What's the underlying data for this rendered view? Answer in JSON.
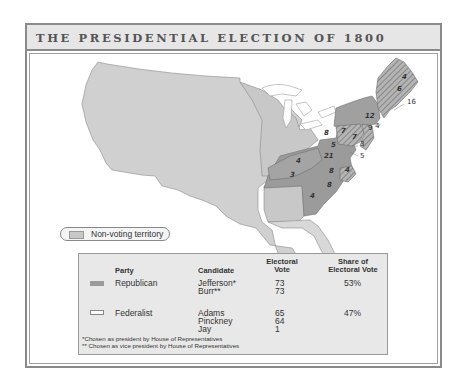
{
  "title": "THE PRESIDENTIAL ELECTION OF 1800",
  "map": {
    "state_votes": [
      {
        "label": "16",
        "x": 407,
        "y": 104,
        "italic": false
      },
      {
        "label": "4",
        "x": 402,
        "y": 79,
        "italic": true
      },
      {
        "label": "6",
        "x": 397,
        "y": 91,
        "italic": true
      },
      {
        "label": "12",
        "x": 365,
        "y": 118,
        "italic": true
      },
      {
        "label": "4",
        "x": 375,
        "y": 128,
        "italic": false
      },
      {
        "label": "9",
        "x": 368,
        "y": 130,
        "italic": false
      },
      {
        "label": "8",
        "x": 324,
        "y": 135,
        "italic": true
      },
      {
        "label": "7",
        "x": 341,
        "y": 133,
        "italic": true
      },
      {
        "label": "7",
        "x": 352,
        "y": 139,
        "italic": true
      },
      {
        "label": "3",
        "x": 360,
        "y": 146,
        "italic": false
      },
      {
        "label": "5",
        "x": 331,
        "y": 147,
        "italic": true
      },
      {
        "label": "21",
        "x": 324,
        "y": 158,
        "italic": true
      },
      {
        "label": "5",
        "x": 360,
        "y": 158,
        "italic": false
      },
      {
        "label": "4",
        "x": 296,
        "y": 163,
        "italic": true
      },
      {
        "label": "8",
        "x": 329,
        "y": 173,
        "italic": true
      },
      {
        "label": "4",
        "x": 345,
        "y": 172,
        "italic": true
      },
      {
        "label": "3",
        "x": 290,
        "y": 177,
        "italic": true
      },
      {
        "label": "8",
        "x": 327,
        "y": 187,
        "italic": true
      },
      {
        "label": "4",
        "x": 310,
        "y": 198,
        "italic": true
      }
    ]
  },
  "legend": {
    "non_voting_label": "Non-voting territory"
  },
  "table": {
    "headers": {
      "party": "Party",
      "candidate": "Candidate",
      "electoral_vote_line1": "Electoral",
      "electoral_vote_line2": "Vote",
      "share_line1": "Share of",
      "share_line2": "Electoral Vote"
    },
    "rows": [
      {
        "party": "Republican",
        "candidates": [
          "Jefferson*",
          "Burr**"
        ],
        "votes": [
          "73",
          "73"
        ],
        "share": "53%"
      },
      {
        "party": "Federalist",
        "candidates": [
          "Adams",
          "Pinckney",
          "Jay"
        ],
        "votes": [
          "65",
          "64",
          "1"
        ],
        "share": "47%"
      }
    ],
    "footnotes": [
      "*Chosen as president by House of Representatives",
      "** Chosen as vice president by House of Representatives"
    ]
  },
  "chart_data": {
    "type": "table",
    "title": "THE PRESIDENTIAL ELECTION OF 1800",
    "columns": [
      "Party",
      "Candidate",
      "Electoral Vote",
      "Share of Electoral Vote"
    ],
    "rows": [
      [
        "Republican",
        "Jefferson*",
        73,
        "53%"
      ],
      [
        "Republican",
        "Burr**",
        73,
        ""
      ],
      [
        "Federalist",
        "Adams",
        65,
        "47%"
      ],
      [
        "Federalist",
        "Pinckney",
        64,
        ""
      ],
      [
        "Federalist",
        "Jay",
        1,
        ""
      ]
    ]
  },
  "colors": {
    "republican": "#9b9b9b",
    "federalist": "#ffffff",
    "non_voting": "#c8c8c8",
    "split_hatch": "#8a8a8a",
    "border": "#8a8a8a",
    "title_bg": "#e6e6e6",
    "table_bg": "#e8e8e8"
  }
}
